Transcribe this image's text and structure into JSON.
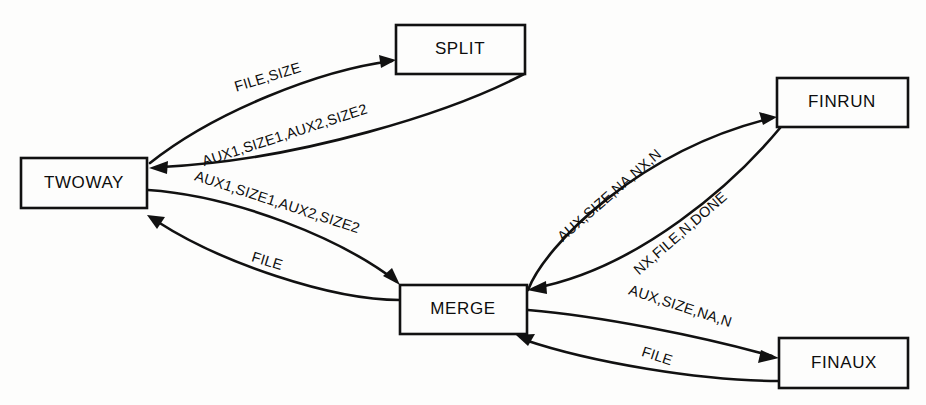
{
  "diagram": {
    "background_color": "#fdfdfc",
    "line_color": "#111111",
    "text_color": "#0d0d0d",
    "nodes": [
      {
        "id": "twoway",
        "label": "TWOWAY",
        "x": 21,
        "y": 158,
        "w": 126,
        "h": 50
      },
      {
        "id": "split",
        "label": "SPLIT",
        "x": 396,
        "y": 25,
        "w": 129,
        "h": 49
      },
      {
        "id": "merge",
        "label": "MERGE",
        "x": 400,
        "y": 285,
        "w": 127,
        "h": 49
      },
      {
        "id": "finrun",
        "label": "FINRUN",
        "x": 777,
        "y": 78,
        "w": 131,
        "h": 49
      },
      {
        "id": "finaux",
        "label": "FINAUX",
        "x": 779,
        "y": 338,
        "w": 129,
        "h": 50
      }
    ],
    "edges": [
      {
        "id": "twoway-split",
        "from": "TWOWAY",
        "to": "SPLIT",
        "label": "FILE,SIZE",
        "label_x": 268,
        "label_y": 78,
        "label_angle": -17
      },
      {
        "id": "split-twoway",
        "from": "SPLIT",
        "to": "TWOWAY",
        "label": "AUX1,SIZE1,AUX2,SIZE2",
        "label_x": 285,
        "label_y": 136,
        "label_angle": -18
      },
      {
        "id": "twoway-merge",
        "from": "TWOWAY",
        "to": "MERGE",
        "label": "AUX1,SIZE1,AUX2,SIZE2",
        "label_x": 277,
        "label_y": 203,
        "label_angle": 18
      },
      {
        "id": "merge-twoway",
        "from": "MERGE",
        "to": "TWOWAY",
        "label": "FILE",
        "label_x": 267,
        "label_y": 262,
        "label_angle": 17
      },
      {
        "id": "merge-finrun",
        "from": "MERGE",
        "to": "FINRUN",
        "label": "AUX,SIZE,NA,NX,N",
        "label_x": 610,
        "label_y": 196,
        "label_angle": -41
      },
      {
        "id": "finrun-merge",
        "from": "FINRUN",
        "to": "MERGE",
        "label": "NX,FILE,N,DONE",
        "label_x": 681,
        "label_y": 234,
        "label_angle": -41
      },
      {
        "id": "merge-finaux",
        "from": "MERGE",
        "to": "FINAUX",
        "label": "AUX,SIZE,NA,N",
        "label_x": 680,
        "label_y": 307,
        "label_angle": 18
      },
      {
        "id": "finaux-merge",
        "from": "FINAUX",
        "to": "MERGE",
        "label": "FILE",
        "label_x": 657,
        "label_y": 357,
        "label_angle": 18
      }
    ]
  }
}
